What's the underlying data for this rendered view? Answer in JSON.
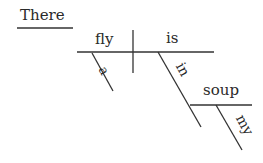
{
  "diagram": {
    "type": "sentence-diagram",
    "words": {
      "expletive": "There",
      "subject": "fly",
      "verb": "is",
      "subject_modifier": "a",
      "preposition": "in",
      "object_of_preposition": "soup",
      "object_modifier": "my"
    },
    "line_color": "#333333"
  }
}
